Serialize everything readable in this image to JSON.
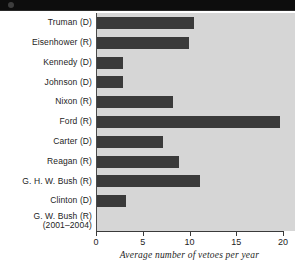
{
  "chart_data": {
    "type": "bar",
    "orientation": "horizontal",
    "title": "",
    "xlabel": "Average number of vetoes per year",
    "ylabel": "",
    "xlim": [
      0,
      20
    ],
    "xticks": [
      0,
      5,
      10,
      15,
      20
    ],
    "grid": false,
    "legend": null,
    "bar_color": "#3a3a3a",
    "plot_background": "#d6d6d6",
    "categories": [
      "Truman (D)",
      "Eisenhower (R)",
      "Kennedy (D)",
      "Johnson (D)",
      "Nixon (R)",
      "Ford (R)",
      "Carter (D)",
      "Reagan (R)",
      "G. H. W. Bush (R)",
      "Clinton (D)",
      "G. W. Bush (R)\n(2001–2004)"
    ],
    "values": [
      10.4,
      9.8,
      2.8,
      2.8,
      8.1,
      19.6,
      7.1,
      8.8,
      11.0,
      3.1,
      0
    ]
  }
}
